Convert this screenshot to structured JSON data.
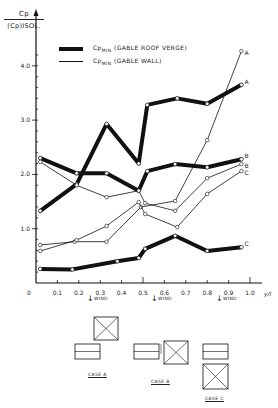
{
  "chart_data": {
    "type": "line",
    "title": "",
    "ylabel": "Cp / (Cp)ISOL.",
    "xlabel": "y/l",
    "xlim": [
      0,
      1.0
    ],
    "ylim": [
      0,
      4.4
    ],
    "x_ticks": [
      "0",
      "0.1",
      "0.2",
      "0.3",
      "0.4",
      "0.5",
      "0.6",
      "0.7",
      "0.8",
      "0.9",
      "1.0"
    ],
    "y_ticks": [
      "1.0",
      "2.0",
      "3.0",
      "4.0"
    ],
    "grid": false,
    "legend_position": "top",
    "legend": [
      {
        "style": "thick",
        "label": "CpMIN (GABLE ROOF VERGE)"
      },
      {
        "style": "thin",
        "label": "CpMIN (GABLE WALL)"
      }
    ],
    "series": [
      {
        "name": "Gable roof verge - Case A",
        "style": "thick",
        "marker": "A",
        "x": [
          0.02,
          0.19,
          0.33,
          0.48,
          0.52,
          0.66,
          0.8,
          0.96
        ],
        "values": [
          1.33,
          1.82,
          2.93,
          2.2,
          3.28,
          3.4,
          3.3,
          3.65
        ]
      },
      {
        "name": "Gable roof verge - Case B",
        "style": "thick",
        "marker": "B",
        "x": [
          0.02,
          0.19,
          0.33,
          0.48,
          0.52,
          0.65,
          0.8,
          0.96
        ],
        "values": [
          2.3,
          2.02,
          2.02,
          1.7,
          2.06,
          2.19,
          2.13,
          2.28
        ]
      },
      {
        "name": "Gable roof verge - Case C",
        "style": "thick",
        "marker": "C",
        "x": [
          0.02,
          0.17,
          0.38,
          0.48,
          0.51,
          0.65,
          0.8,
          0.96
        ],
        "values": [
          0.26,
          0.25,
          0.4,
          0.46,
          0.63,
          0.87,
          0.59,
          0.66
        ]
      },
      {
        "name": "Gable wall - Case A",
        "style": "thin",
        "marker": "A",
        "x": [
          0.02,
          0.18,
          0.33,
          0.49,
          0.65,
          0.8,
          0.96
        ],
        "values": [
          0.7,
          0.76,
          0.76,
          1.4,
          1.51,
          2.63,
          4.27
        ]
      },
      {
        "name": "Gable wall - Case B",
        "style": "thin",
        "marker": "B",
        "x": [
          0.02,
          0.19,
          0.33,
          0.48,
          0.51,
          0.65,
          0.8,
          0.96
        ],
        "values": [
          2.23,
          1.8,
          1.58,
          1.7,
          1.47,
          1.33,
          1.93,
          2.19
        ]
      },
      {
        "name": "Gable wall - Case C",
        "style": "thin",
        "marker": "C",
        "x": [
          0.02,
          0.19,
          0.33,
          0.48,
          0.51,
          0.66,
          0.8,
          0.96
        ],
        "values": [
          0.59,
          0.79,
          1.05,
          1.49,
          1.27,
          1.03,
          1.64,
          2.06
        ]
      }
    ],
    "annotations": [
      "WIND",
      "WIND",
      "WIND",
      "CASE A",
      "CASE B",
      "CASE C"
    ]
  },
  "labels": {
    "y_num": "Cp",
    "y_den": "(Cp)ISOL.",
    "legend_thick_main": "Cp",
    "legend_thick_sub": "MIN",
    "legend_thick_rest": " (GABLE ROOF VERGE)",
    "legend_thin_main": "Cp",
    "legend_thin_sub": "MIN",
    "legend_thin_rest": " (GABLE WALL)",
    "wind": "WIND",
    "case_a": "CASE A",
    "case_b": "CASE B",
    "case_c": "CASE C"
  }
}
